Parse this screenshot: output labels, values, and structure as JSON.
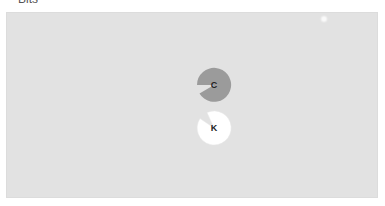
{
  "header": {
    "label": "Bits"
  },
  "stage": {
    "background": "#e2e2e2"
  },
  "tokens": [
    {
      "letter": "C",
      "fill": "#9b9b9b",
      "mouth_direction": "lower-left"
    },
    {
      "letter": "K",
      "fill": "#ffffff",
      "mouth_direction": "upper-left"
    }
  ]
}
